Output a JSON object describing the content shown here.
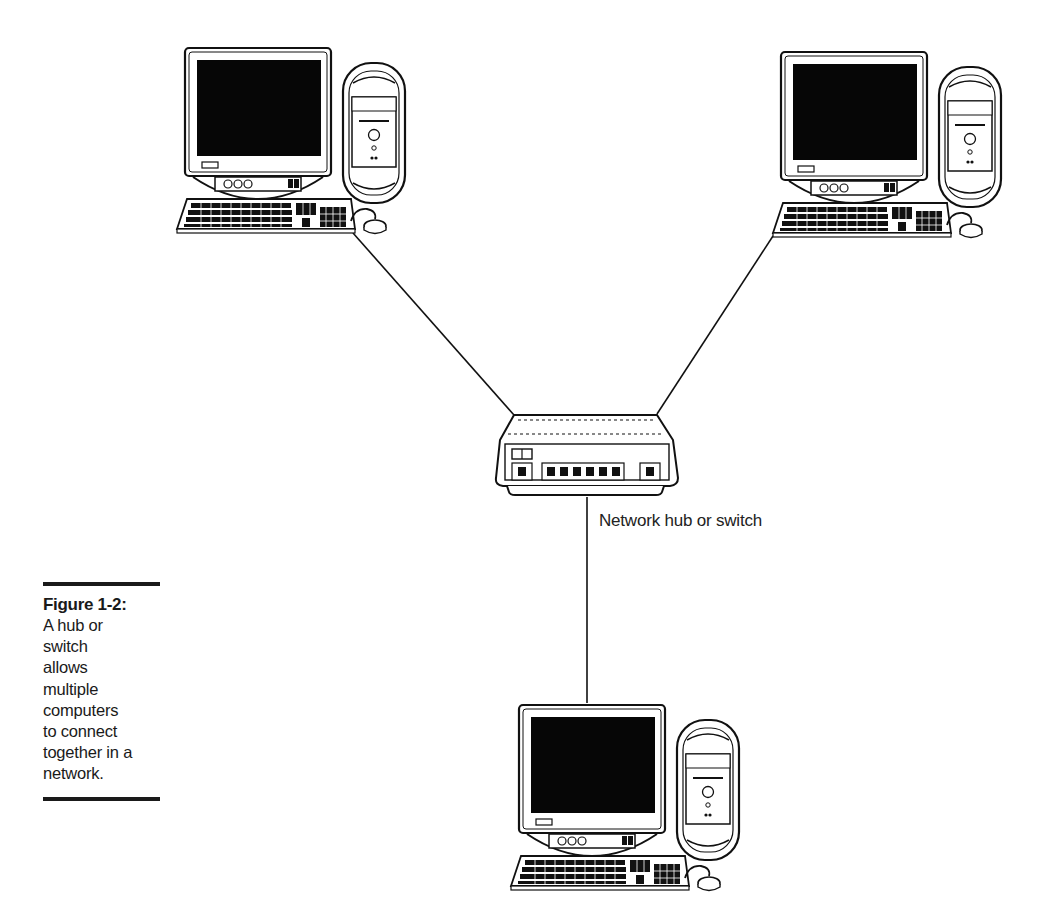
{
  "figure": {
    "number_label": "Figure 1-2:",
    "caption_lines": [
      "A hub or",
      "switch",
      "allows",
      "multiple",
      "computers",
      "to connect",
      "together in a",
      "network."
    ]
  },
  "diagram": {
    "hub_label": "Network hub or switch",
    "nodes": [
      {
        "id": "computer-top-left",
        "type": "desktop-computer",
        "x": 175,
        "y": 45
      },
      {
        "id": "computer-top-right",
        "type": "desktop-computer",
        "x": 772,
        "y": 48
      },
      {
        "id": "computer-bottom",
        "type": "desktop-computer",
        "x": 510,
        "y": 700
      },
      {
        "id": "hub",
        "type": "network-hub",
        "x": 495,
        "y": 415
      }
    ],
    "links": [
      {
        "from": "computer-top-left",
        "to": "hub"
      },
      {
        "from": "computer-top-right",
        "to": "hub"
      },
      {
        "from": "hub",
        "to": "computer-bottom"
      }
    ],
    "colors": {
      "ink": "#111111",
      "screen": "#050505",
      "paper": "#ffffff"
    }
  }
}
